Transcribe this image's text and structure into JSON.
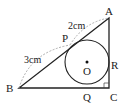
{
  "diagram": {
    "type": "geometry",
    "points": {
      "A": {
        "label": "A",
        "x": 109,
        "y": 18
      },
      "B": {
        "label": "B",
        "x": 19,
        "y": 88
      },
      "C": {
        "label": "C",
        "x": 109,
        "y": 88
      },
      "O": {
        "label": "O",
        "x": 87,
        "y": 62
      },
      "P": {
        "label": "P",
        "x": 70,
        "y": 45
      },
      "Q": {
        "label": "Q",
        "x": 87,
        "y": 88
      },
      "R": {
        "label": "R",
        "x": 109,
        "y": 62
      }
    },
    "circle": {
      "center": "O",
      "radius": 22
    },
    "measurements": {
      "AP": "2cm",
      "BP": "3cm"
    },
    "right_angle_at": "C",
    "colors": {
      "line": "#222222",
      "dashed": "#9a9a9a",
      "background": "#ffffff"
    }
  }
}
